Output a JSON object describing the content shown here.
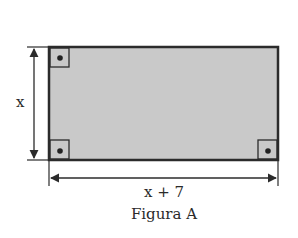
{
  "figure": {
    "caption": "Figura A",
    "height_label": "x",
    "width_label": "x + 7",
    "shape": "rectangle",
    "right_angle_markers": [
      "top-left",
      "bottom-left",
      "bottom-right"
    ],
    "colors": {
      "fill": "#c9c9c9",
      "stroke": "#2b2b2b",
      "background": "#ffffff"
    }
  }
}
